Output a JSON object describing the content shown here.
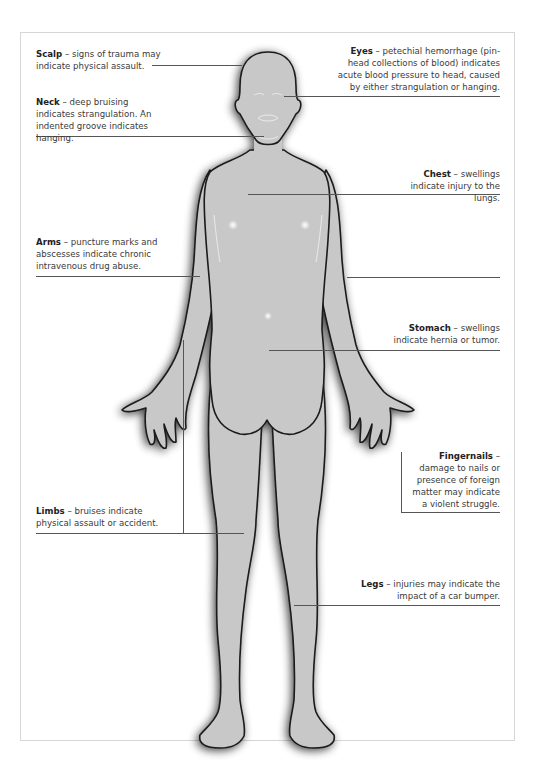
{
  "diagram": {
    "type": "anatomical-annotation",
    "annotations": [
      {
        "id": "scalp",
        "term": "Scalp",
        "sep": " – ",
        "text": "signs of trauma may indicate physical assault.",
        "side": "left"
      },
      {
        "id": "neck",
        "term": "Neck",
        "sep": " – ",
        "text": "deep bruising indicates strangulation. An indented groove indicates hanging.",
        "side": "left"
      },
      {
        "id": "arms",
        "term": "Arms",
        "sep": " – ",
        "text": "puncture marks and abscesses indicate chronic intravenous drug abuse.",
        "side": "left"
      },
      {
        "id": "limbs",
        "term": "Limbs",
        "sep": " – ",
        "text": "bruises indicate physical assault or accident.",
        "side": "left"
      },
      {
        "id": "eyes",
        "term": "Eyes",
        "sep": " – ",
        "text": "petechial hemorrhage (pin-head collections of blood) indicates acute blood pressure to head, caused by either strangulation or hanging.",
        "side": "right"
      },
      {
        "id": "chest",
        "term": "Chest",
        "sep": " – ",
        "text": "swellings indicate injury to the lungs.",
        "side": "right"
      },
      {
        "id": "stomach",
        "term": "Stomach",
        "sep": " – ",
        "text": "swellings indicate hernia or tumor.",
        "side": "right"
      },
      {
        "id": "fingernails",
        "term": "Fingernails",
        "sep": " –",
        "text": "damage to nails or presence of foreign matter may indicate a violent struggle.",
        "side": "right"
      },
      {
        "id": "legs",
        "term": "Legs",
        "sep": " – ",
        "text": "injuries may indicate the impact of a car bumper.",
        "side": "right"
      }
    ]
  },
  "colors": {
    "body_fill": "#c9c9c9",
    "outline": "#1a1a1a",
    "leader": "#555555",
    "frame": "#d6d6d6"
  }
}
